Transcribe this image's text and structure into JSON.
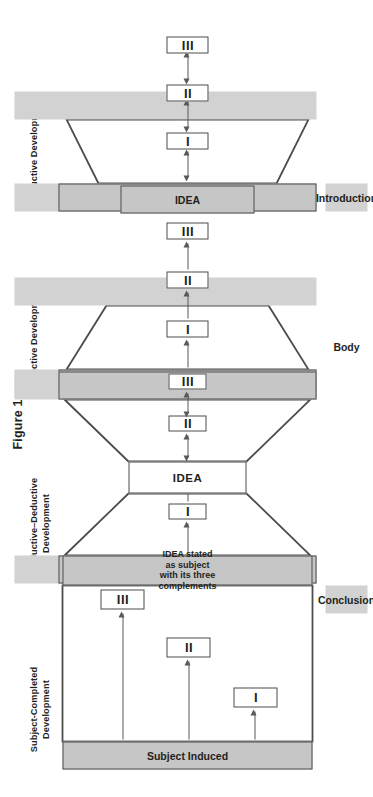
{
  "figure": {
    "title": "Figure 1",
    "colors": {
      "rail_gray": "#d2d2d2",
      "block_gray": "#c6c6c6",
      "outline": "#4d4d4d",
      "arrow": "#58595b",
      "text": "#231f20",
      "page_bg": "#ffffff"
    }
  },
  "section_labels": {
    "introduction": "Introduction",
    "body": "Body",
    "conclusion": "Conclusion"
  },
  "panels": [
    {
      "id": "deductive",
      "header": "Deductive Development",
      "intro_block": "IDEA",
      "conclusion_block": "",
      "shape": "trapezoid-widening",
      "items": [
        "I",
        "II",
        "III"
      ],
      "arrows": "double-headed",
      "arrow_sequence": [
        "IDEA<->I",
        "I<->II",
        "II<->III"
      ]
    },
    {
      "id": "inductive",
      "header": "Inductive Development",
      "intro_block": "",
      "conclusion_block": "IDEA",
      "shape": "trapezoid-narrowing",
      "items": [
        "I",
        "II",
        "III"
      ],
      "arrows": "single-headed",
      "arrow_sequence": [
        "start->I",
        "I->II",
        "II->III"
      ]
    },
    {
      "id": "inductive-deductive",
      "header": "Inductive–Deductive Development",
      "header_line1": "Inductive–Deductive",
      "header_line2": "Development",
      "intro_block": "",
      "conclusion_block": "",
      "shape": "bowtie",
      "center_block": "IDEA",
      "items": [
        "I",
        "II",
        "III"
      ],
      "arrows": "mixed",
      "arrow_sequence": [
        "start->I",
        "I->IDEA",
        "IDEA<->II",
        "II<->III"
      ]
    },
    {
      "id": "subject-completed",
      "header": "Subject-Completed Development",
      "header_line1": "Subject-Completed",
      "header_line2": "Development",
      "intro_block": "Subject Induced",
      "conclusion_block": "IDEA stated as subject with its three complements",
      "shape": "rectangle",
      "items": [
        "I",
        "II",
        "III"
      ],
      "arrows": "single-headed-fanout",
      "arrow_sequence": [
        "Subject Induced->I",
        "Subject Induced->II",
        "Subject Induced->III"
      ]
    }
  ]
}
